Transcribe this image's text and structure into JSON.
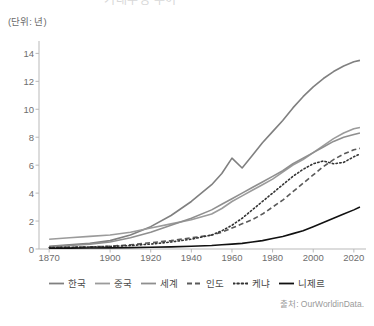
{
  "title": "기대수명 추이",
  "unit_label": "(단위: 년)",
  "source": "출처: OurWorldinData.",
  "axes": {
    "y_ticks": [
      "0",
      "2",
      "4",
      "6",
      "8",
      "10",
      "12",
      "14"
    ],
    "x_ticks": [
      "1870",
      "1900",
      "1920",
      "1940",
      "1960",
      "1980",
      "2000",
      "2020"
    ]
  },
  "legend": {
    "items": [
      {
        "label": "한국",
        "style": "solid",
        "color": "#808080",
        "width": 1.6
      },
      {
        "label": "중국",
        "style": "solid",
        "color": "#9b9b9b",
        "width": 1.6
      },
      {
        "label": "세계",
        "style": "solid",
        "color": "#8f8f8f",
        "width": 1.6
      },
      {
        "label": "인도",
        "style": "dashed",
        "color": "#5a5a5a",
        "width": 1.6
      },
      {
        "label": "케냐",
        "style": "dotted",
        "color": "#333333",
        "width": 1.8
      },
      {
        "label": "니제르",
        "style": "solid",
        "color": "#111111",
        "width": 1.6
      }
    ]
  },
  "chart_data": {
    "type": "line",
    "title": "기대수명 추이",
    "xlabel": "",
    "ylabel": "(단위: 년)",
    "xlim": [
      1865,
      2025
    ],
    "ylim": [
      0,
      14.6
    ],
    "grid": false,
    "legend_position": "bottom",
    "x": [
      1870,
      1880,
      1890,
      1900,
      1910,
      1920,
      1930,
      1940,
      1950,
      1955,
      1960,
      1965,
      1970,
      1975,
      1980,
      1985,
      1990,
      1995,
      2000,
      2005,
      2010,
      2015,
      2020,
      2023
    ],
    "series": [
      {
        "name": "한국",
        "style": "solid",
        "color": "#808080",
        "values": [
          0.2,
          0.3,
          0.4,
          0.6,
          1.0,
          1.6,
          2.4,
          3.4,
          4.6,
          5.4,
          6.5,
          5.8,
          6.7,
          7.6,
          8.4,
          9.2,
          10.1,
          10.9,
          11.6,
          12.2,
          12.7,
          13.1,
          13.4,
          13.5
        ]
      },
      {
        "name": "중국",
        "style": "solid",
        "color": "#9b9b9b",
        "values": [
          0.7,
          0.8,
          0.9,
          1.0,
          1.2,
          1.5,
          1.8,
          2.1,
          2.5,
          2.9,
          3.4,
          3.8,
          4.2,
          4.6,
          5.0,
          5.5,
          6.0,
          6.4,
          6.9,
          7.4,
          7.9,
          8.3,
          8.6,
          8.7
        ]
      },
      {
        "name": "세계",
        "style": "solid",
        "color": "#8f8f8f",
        "values": [
          0.15,
          0.25,
          0.35,
          0.5,
          0.8,
          1.2,
          1.7,
          2.2,
          2.8,
          3.2,
          3.6,
          4.0,
          4.4,
          4.8,
          5.2,
          5.6,
          6.1,
          6.5,
          6.9,
          7.3,
          7.7,
          8.0,
          8.2,
          8.3
        ]
      },
      {
        "name": "인도",
        "style": "dashed",
        "color": "#5a5a5a",
        "values": [
          0.1,
          0.12,
          0.15,
          0.2,
          0.3,
          0.45,
          0.6,
          0.8,
          1.0,
          1.2,
          1.5,
          1.8,
          2.1,
          2.5,
          3.0,
          3.5,
          4.1,
          4.7,
          5.3,
          5.9,
          6.4,
          6.8,
          7.1,
          7.2
        ]
      },
      {
        "name": "케냐",
        "style": "dotted",
        "color": "#333333",
        "values": [
          0.1,
          0.12,
          0.15,
          0.18,
          0.25,
          0.35,
          0.5,
          0.7,
          1.0,
          1.3,
          1.7,
          2.2,
          2.8,
          3.4,
          4.0,
          4.6,
          5.2,
          5.7,
          6.1,
          6.3,
          6.1,
          6.2,
          6.6,
          6.8
        ]
      },
      {
        "name": "니제르",
        "style": "solid",
        "color": "#111111",
        "values": [
          0.05,
          0.06,
          0.07,
          0.08,
          0.1,
          0.12,
          0.15,
          0.2,
          0.25,
          0.3,
          0.35,
          0.4,
          0.5,
          0.6,
          0.75,
          0.9,
          1.1,
          1.3,
          1.6,
          1.9,
          2.2,
          2.5,
          2.8,
          3.0
        ]
      }
    ]
  }
}
